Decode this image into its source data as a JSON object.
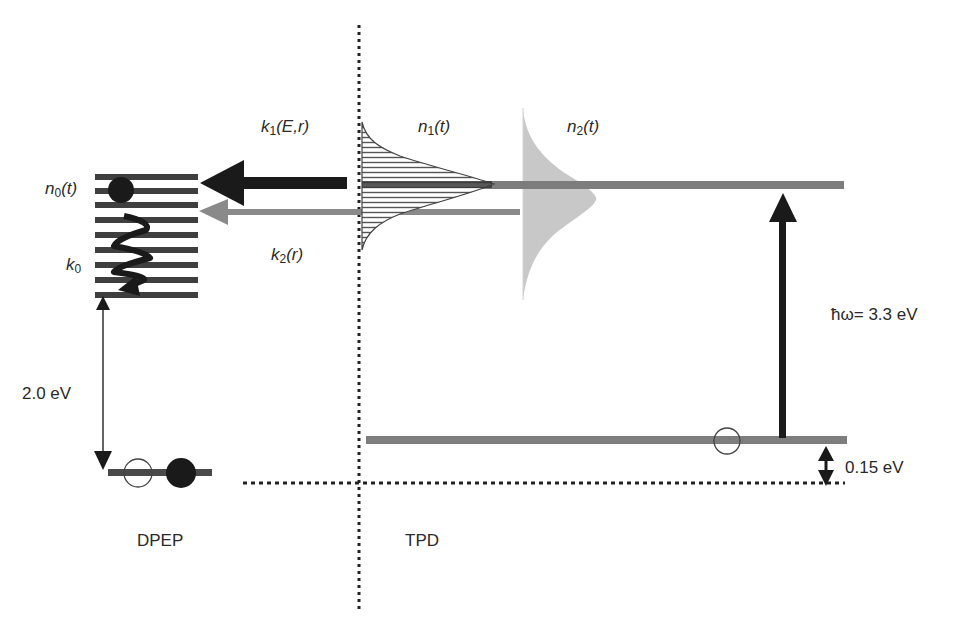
{
  "diagram": {
    "title": "",
    "regions": [
      {
        "name": "DPEP",
        "label": "DPEP"
      },
      {
        "name": "TPD",
        "label": "TPD"
      }
    ],
    "labels": {
      "n0": {
        "base": "n",
        "sub": "0",
        "arg": "(t)"
      },
      "k0": {
        "base": "k",
        "sub": "0"
      },
      "k1": {
        "base": "k",
        "sub": "1",
        "arg": "(E,r)"
      },
      "k2": {
        "base": "k",
        "sub": "2",
        "arg": "(r)"
      },
      "n1": {
        "base": "n",
        "sub": "1",
        "arg": "(t)"
      },
      "n2": {
        "base": "n",
        "sub": "2",
        "arg": "(t)"
      },
      "gap_dpep": "2.0 eV",
      "photon": "ħω= 3.3 eV",
      "gap_tpd": "0.15 eV",
      "dpep": "DPEP",
      "tpd": "TPD"
    },
    "nodes": [
      {
        "id": "dpep-excited-manifold",
        "description": "stack of 9 closely spaced excited-state levels in DPEP with electron (filled circle) at top and relaxation zigzag k0"
      },
      {
        "id": "dpep-ground-level",
        "description": "DPEP ground level with hole (open circle) and electron (filled circle)"
      },
      {
        "id": "tpd-upper-level",
        "description": "TPD excited level with density of states n1(t) (hatched Gaussian) and n2(t) (grey Gaussian)"
      },
      {
        "id": "tpd-lower-level",
        "description": "TPD level with hole (open circle), 0.15 eV above dotted reference"
      }
    ],
    "edges": [
      {
        "from": "tpd-upper-level",
        "to": "dpep-excited-manifold",
        "label": "k1(E,r)",
        "style": "thick black arrow"
      },
      {
        "from": "tpd-upper-level",
        "to": "dpep-excited-manifold",
        "label": "k2(r)",
        "style": "grey arrow"
      },
      {
        "from": "tpd-lower-level",
        "to": "tpd-upper-level",
        "label": "ħω= 3.3 eV",
        "style": "black vertical arrow"
      },
      {
        "from": "dpep-excited-manifold",
        "to": "dpep-ground-level",
        "label": "2.0 eV",
        "style": "thin double arrow"
      },
      {
        "from": "tpd-lower-level",
        "to": "reference-line",
        "label": "0.15 eV",
        "style": "short double arrow"
      }
    ],
    "colors": {
      "level_grey": "#7a7a7a",
      "level_dark": "#3a3a3a",
      "arrow_black": "#1a1a1a",
      "arrow_grey": "#8a8a8a",
      "n2_fill": "#c8c8c8",
      "dots": "#222222"
    }
  }
}
